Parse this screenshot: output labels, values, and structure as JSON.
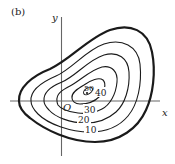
{
  "figure": {
    "panel_label": "(b)",
    "type": "contour map",
    "axes": {
      "x_label": "x",
      "y_label": "y",
      "origin_label": "O"
    },
    "contours": [
      {
        "level": "10",
        "label": "10"
      },
      {
        "level": "20",
        "label": "20"
      },
      {
        "level": "30",
        "label": "30"
      },
      {
        "level": "40",
        "label": "40"
      },
      {
        "level": "50",
        "label": "50"
      }
    ],
    "colors": {
      "lines": "#222222",
      "axes": "#555555",
      "background": "#ffffff"
    }
  }
}
